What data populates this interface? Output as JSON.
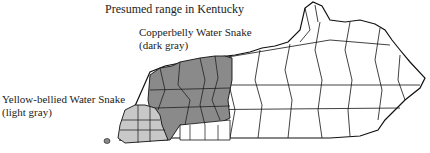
{
  "map": {
    "title": "Presumed range in Kentucky",
    "legend": [
      {
        "name": "Copperbelly Water Snake",
        "note": "(dark gray)",
        "color": "#8a8a8a"
      },
      {
        "name": "Yellow-bellied Water Snake",
        "note": "(light gray)",
        "color": "#c8c8c8"
      }
    ],
    "county_fill": "#ffffff",
    "border_color": "#111111"
  }
}
